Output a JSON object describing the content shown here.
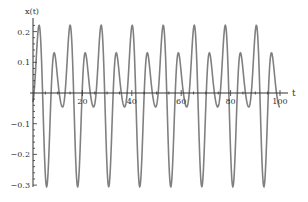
{
  "chart_data": {
    "type": "line",
    "title": "",
    "xlabel": "t",
    "ylabel": "x(t)",
    "xlim": [
      0,
      100
    ],
    "ylim": [
      -0.3,
      0.23
    ],
    "grid": false,
    "legend": null,
    "x_ticks": [
      20,
      40,
      60,
      80,
      100
    ],
    "x_tick_labels": [
      "20",
      "40",
      "60",
      "80",
      "100"
    ],
    "y_ticks": [
      0.2,
      0.1,
      -0.1,
      -0.2,
      -0.3
    ],
    "y_tick_labels": [
      "0.2",
      "0.1",
      "-0.1",
      "-0.2",
      "-0.3"
    ],
    "series": [
      {
        "name": "x(t)",
        "color": "#808080",
        "description": "periodic oscillation, period ≈ 12.57 (4π); per period: tall peak ≈ 0.22, deep trough ≈ -0.30, short peak ≈ 0.13, small dip ≈ -0.04",
        "model": {
          "phase_t0": 2.4,
          "harmonics": [
            {
              "omega": 0.5,
              "cos": 0.03,
              "sin": -0.09
            },
            {
              "omega": 1.0,
              "cos": 0.175,
              "sin": 0.0
            },
            {
              "omega": 1.5,
              "cos": 0.015,
              "sin": 0.04
            }
          ]
        },
        "tall_peaks": {
          "t": [
            2.4,
            15.0,
            27.5,
            40.1,
            52.7,
            65.2,
            77.8,
            90.3
          ],
          "value": 0.22
        },
        "short_peaks": {
          "t": [
            9.1,
            21.7,
            34.2,
            46.8,
            59.4,
            71.9,
            84.5,
            97.0
          ],
          "value": 0.13
        },
        "troughs": {
          "t": [
            5.7,
            18.3,
            30.9,
            43.4,
            56.0,
            68.5,
            81.1,
            93.7
          ],
          "value": -0.3
        },
        "small_dips": {
          "t": [
            12.1,
            24.7,
            37.2,
            49.8,
            62.4,
            74.9,
            87.5,
            100.0
          ],
          "value": -0.04
        }
      }
    ]
  },
  "axes": {
    "x_label": "t",
    "y_label": "x(t)"
  }
}
